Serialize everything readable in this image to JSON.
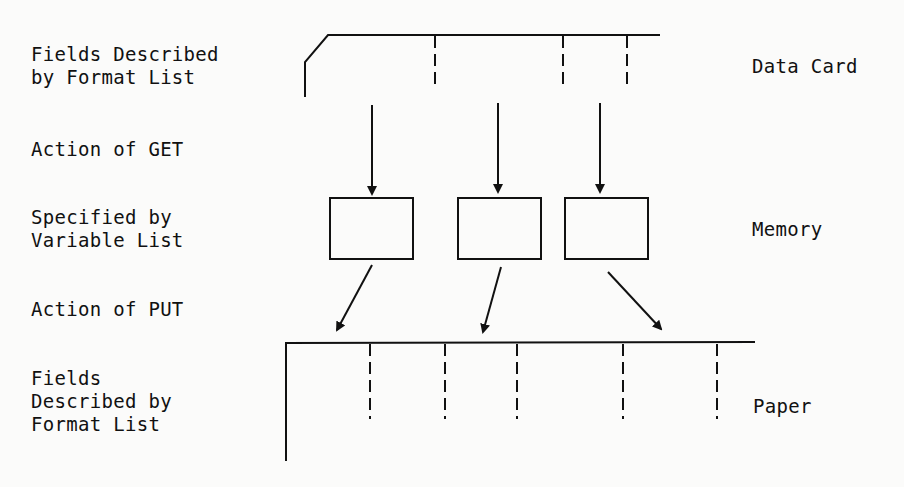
{
  "left_labels": {
    "card_fields": "Fields Described\nby Format List",
    "get_action": "Action of GET",
    "variable_list": "Specified by\nVariable List",
    "put_action": "Action of PUT",
    "paper_fields": "Fields\nDescribed by\nFormat List"
  },
  "right_labels": {
    "data_card": "Data Card",
    "memory": "Memory",
    "paper": "Paper"
  },
  "colors": {
    "ink": "#111111",
    "background": "#fbfbfa"
  }
}
